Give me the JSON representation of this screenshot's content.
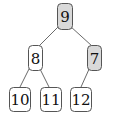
{
  "diagram": {
    "type": "binary-tree",
    "colors": {
      "highlight_fill": "#d9d9d9",
      "normal_fill": "#ffffff",
      "border": "#555555",
      "edge": "#6a6a6a",
      "text": "#111111"
    },
    "nodes": [
      {
        "id": "n9",
        "label": "9",
        "highlighted": true,
        "x": 57,
        "y": 3,
        "w": 15,
        "h": 26
      },
      {
        "id": "n8",
        "label": "8",
        "highlighted": false,
        "x": 28,
        "y": 45,
        "w": 14,
        "h": 25
      },
      {
        "id": "n7",
        "label": "7",
        "highlighted": true,
        "x": 87,
        "y": 45,
        "w": 14,
        "h": 25
      },
      {
        "id": "n10",
        "label": "10",
        "highlighted": false,
        "x": 9,
        "y": 87,
        "w": 21,
        "h": 24
      },
      {
        "id": "n11",
        "label": "11",
        "highlighted": false,
        "x": 40,
        "y": 87,
        "w": 21,
        "h": 24
      },
      {
        "id": "n12",
        "label": "12",
        "highlighted": false,
        "x": 70,
        "y": 87,
        "w": 21,
        "h": 24
      }
    ],
    "edges": [
      {
        "from": "n9",
        "to": "n8",
        "x1": 59,
        "y1": 26,
        "x2": 39,
        "y2": 46
      },
      {
        "from": "n9",
        "to": "n7",
        "x1": 70,
        "y1": 26,
        "x2": 92,
        "y2": 46
      },
      {
        "from": "n8",
        "to": "n10",
        "x1": 30,
        "y1": 67,
        "x2": 20,
        "y2": 87
      },
      {
        "from": "n8",
        "to": "n11",
        "x1": 39,
        "y1": 67,
        "x2": 49,
        "y2": 87
      },
      {
        "from": "n7",
        "to": "n12",
        "x1": 90,
        "y1": 67,
        "x2": 81,
        "y2": 87
      }
    ]
  }
}
